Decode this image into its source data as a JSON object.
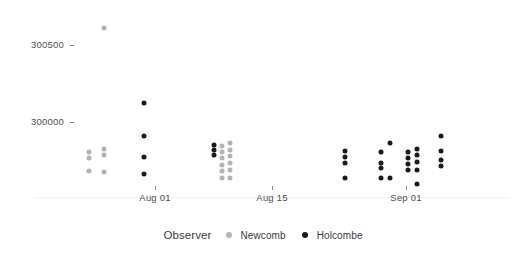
{
  "chart_data": {
    "type": "scatter",
    "title": "",
    "xlabel": "",
    "ylabel": "",
    "grid": false,
    "legend_position": "bottom",
    "legend_title": "Observer",
    "x_axis": {
      "tick_labels": [
        "Aug 01",
        "Aug 15",
        "Sep 01"
      ],
      "tick_positions_px": [
        155,
        272,
        406
      ],
      "range_label": "Jul 1879 - Sep 1879"
    },
    "y_axis": {
      "tick_labels": [
        "300500",
        "300000"
      ],
      "tick_values": [
        300500,
        300000
      ],
      "tick_positions_px": [
        45,
        122
      ],
      "ylim": [
        299650,
        300750
      ]
    },
    "series": [
      {
        "name": "Newcomb",
        "color": "#b3b3b3",
        "marker": "circle",
        "point_size_px": 5,
        "points": [
          {
            "x_px": 104,
            "y_px": 28,
            "date": "Jul 24",
            "value": 300640
          },
          {
            "x_px": 89,
            "y_px": 152,
            "date": "Jul 27",
            "value": 299850
          },
          {
            "x_px": 89,
            "y_px": 158,
            "date": "Jul 27",
            "value": 299810
          },
          {
            "x_px": 89,
            "y_px": 171,
            "date": "Jul 27",
            "value": 299730
          },
          {
            "x_px": 104,
            "y_px": 149,
            "date": "Jul 29",
            "value": 299870
          },
          {
            "x_px": 104,
            "y_px": 155,
            "date": "Jul 29",
            "value": 299830
          },
          {
            "x_px": 104,
            "y_px": 172,
            "date": "Jul 29",
            "value": 299720
          },
          {
            "x_px": 222,
            "y_px": 146,
            "date": "Aug 13",
            "value": 299890
          },
          {
            "x_px": 222,
            "y_px": 152,
            "date": "Aug 13",
            "value": 299850
          },
          {
            "x_px": 222,
            "y_px": 158,
            "date": "Aug 13",
            "value": 299810
          },
          {
            "x_px": 222,
            "y_px": 165,
            "date": "Aug 13",
            "value": 299770
          },
          {
            "x_px": 222,
            "y_px": 171,
            "date": "Aug 13",
            "value": 299730
          },
          {
            "x_px": 222,
            "y_px": 178,
            "date": "Aug 13",
            "value": 299685
          },
          {
            "x_px": 230,
            "y_px": 143,
            "date": "Aug 14",
            "value": 299910
          },
          {
            "x_px": 230,
            "y_px": 150,
            "date": "Aug 14",
            "value": 299865
          },
          {
            "x_px": 230,
            "y_px": 156,
            "date": "Aug 14",
            "value": 299825
          },
          {
            "x_px": 230,
            "y_px": 163,
            "date": "Aug 14",
            "value": 299780
          },
          {
            "x_px": 230,
            "y_px": 170,
            "date": "Aug 14",
            "value": 299735
          },
          {
            "x_px": 230,
            "y_px": 178,
            "date": "Aug 14",
            "value": 299685
          }
        ]
      },
      {
        "name": "Holcombe",
        "color": "#1a1a1a",
        "marker": "circle",
        "point_size_px": 5,
        "points": [
          {
            "x_px": 144,
            "y_px": 103,
            "date": "Aug 01",
            "value": 300250
          },
          {
            "x_px": 144,
            "y_px": 136,
            "date": "Aug 01",
            "value": 300040
          },
          {
            "x_px": 144,
            "y_px": 157,
            "date": "Aug 01",
            "value": 299905
          },
          {
            "x_px": 144,
            "y_px": 174,
            "date": "Aug 01",
            "value": 299795
          },
          {
            "x_px": 214,
            "y_px": 145,
            "date": "Aug 12",
            "value": 299985
          },
          {
            "x_px": 214,
            "y_px": 150,
            "date": "Aug 12",
            "value": 299955
          },
          {
            "x_px": 214,
            "y_px": 155,
            "date": "Aug 12",
            "value": 299920
          },
          {
            "x_px": 345,
            "y_px": 151,
            "date": "Aug 28",
            "value": 299945
          },
          {
            "x_px": 345,
            "y_px": 157,
            "date": "Aug 28",
            "value": 299905
          },
          {
            "x_px": 345,
            "y_px": 163,
            "date": "Aug 28",
            "value": 299870
          },
          {
            "x_px": 345,
            "y_px": 178,
            "date": "Aug 28",
            "value": 299775
          },
          {
            "x_px": 381,
            "y_px": 152,
            "date": "Sep 01",
            "value": 299940
          },
          {
            "x_px": 381,
            "y_px": 163,
            "date": "Sep 01",
            "value": 299870
          },
          {
            "x_px": 381,
            "y_px": 168,
            "date": "Sep 01",
            "value": 299840
          },
          {
            "x_px": 381,
            "y_px": 178,
            "date": "Sep 01",
            "value": 299775
          },
          {
            "x_px": 390,
            "y_px": 143,
            "date": "Sep 02",
            "value": 300000
          },
          {
            "x_px": 390,
            "y_px": 178,
            "date": "Sep 02",
            "value": 299775
          },
          {
            "x_px": 408,
            "y_px": 152,
            "date": "Sep 03",
            "value": 299940
          },
          {
            "x_px": 408,
            "y_px": 158,
            "date": "Sep 03",
            "value": 299900
          },
          {
            "x_px": 408,
            "y_px": 164,
            "date": "Sep 03",
            "value": 299865
          },
          {
            "x_px": 408,
            "y_px": 170,
            "date": "Sep 03",
            "value": 299825
          },
          {
            "x_px": 417,
            "y_px": 149,
            "date": "Sep 04",
            "value": 299960
          },
          {
            "x_px": 417,
            "y_px": 155,
            "date": "Sep 04",
            "value": 299925
          },
          {
            "x_px": 417,
            "y_px": 162,
            "date": "Sep 04",
            "value": 299880
          },
          {
            "x_px": 417,
            "y_px": 170,
            "date": "Sep 04",
            "value": 299825
          },
          {
            "x_px": 417,
            "y_px": 184,
            "date": "Sep 04",
            "value": 299740
          },
          {
            "x_px": 441,
            "y_px": 136,
            "date": "Sep 07",
            "value": 300040
          },
          {
            "x_px": 441,
            "y_px": 151,
            "date": "Sep 07",
            "value": 299945
          },
          {
            "x_px": 441,
            "y_px": 160,
            "date": "Sep 07",
            "value": 299890
          },
          {
            "x_px": 441,
            "y_px": 166,
            "date": "Sep 07",
            "value": 299850
          }
        ]
      }
    ]
  },
  "legend": {
    "title": "Observer",
    "items": [
      {
        "label": "Newcomb",
        "color": "#b3b3b3"
      },
      {
        "label": "Holcombe",
        "color": "#1a1a1a"
      }
    ]
  },
  "colors": {
    "newcomb": "#b3b3b3",
    "holcombe": "#1a1a1a",
    "axis_text": "#4d4d4d",
    "axis_line": "#efefef",
    "background": "#ffffff"
  }
}
